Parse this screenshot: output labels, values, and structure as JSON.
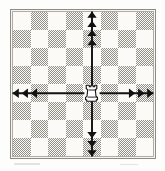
{
  "figure": {
    "kind": "chess-move-diagram"
  },
  "board": {
    "files": 8,
    "ranks": 8,
    "light_color": "#fbfaf7",
    "dark_color": "#8f8f88",
    "border_color": "#8d8d86",
    "top_left_square": "light",
    "squares": [
      [
        "light",
        "dark",
        "light",
        "dark",
        "light",
        "dark",
        "light",
        "dark"
      ],
      [
        "dark",
        "light",
        "dark",
        "light",
        "dark",
        "light",
        "dark",
        "light"
      ],
      [
        "light",
        "dark",
        "light",
        "dark",
        "light",
        "dark",
        "light",
        "dark"
      ],
      [
        "dark",
        "light",
        "dark",
        "light",
        "dark",
        "light",
        "dark",
        "light"
      ],
      [
        "light",
        "dark",
        "light",
        "dark",
        "light",
        "dark",
        "light",
        "dark"
      ],
      [
        "dark",
        "light",
        "dark",
        "light",
        "dark",
        "light",
        "dark",
        "light"
      ],
      [
        "light",
        "dark",
        "light",
        "dark",
        "light",
        "dark",
        "light",
        "dark"
      ],
      [
        "dark",
        "light",
        "dark",
        "light",
        "dark",
        "light",
        "dark",
        "light"
      ]
    ]
  },
  "piece": {
    "name": "rook",
    "color": "white",
    "glyph": "rook-icon",
    "column_index": 4,
    "row_index": 4
  },
  "arrows": {
    "color": "#111111",
    "items": [
      {
        "name": "arrow-up",
        "direction": "up",
        "heads": 4,
        "from_square_index": 4,
        "to_square_index": 0
      },
      {
        "name": "arrow-down",
        "direction": "down",
        "heads": 3,
        "from_square_index": 4,
        "to_square_index": 7
      },
      {
        "name": "arrow-left",
        "direction": "left",
        "heads": 3,
        "from_square_index": 4,
        "to_square_index": 0
      },
      {
        "name": "arrow-right",
        "direction": "right",
        "heads": 3,
        "from_square_index": 4,
        "to_square_index": 7
      }
    ]
  }
}
